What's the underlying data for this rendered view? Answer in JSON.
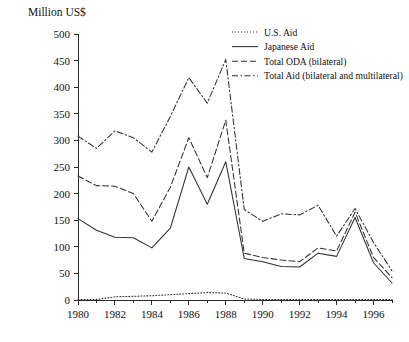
{
  "chart_data": {
    "type": "line",
    "title": "",
    "ylabel": "Million US$",
    "xlabel": "",
    "ylim": [
      0,
      500
    ],
    "xlim": [
      1980,
      1997
    ],
    "ytick_step": 50,
    "grid": false,
    "legend_position": "top-right",
    "yticks": [
      0,
      50,
      100,
      150,
      200,
      250,
      300,
      350,
      400,
      450,
      500
    ],
    "ytick_labels": [
      "0",
      "50",
      "100",
      "150",
      "200",
      "250",
      "300",
      "350",
      "400",
      "450",
      "500"
    ],
    "x": [
      1980,
      1981,
      1982,
      1983,
      1984,
      1985,
      1986,
      1987,
      1988,
      1989,
      1990,
      1991,
      1992,
      1993,
      1994,
      1995,
      1996,
      1997
    ],
    "xticks_major": [
      1980,
      1982,
      1984,
      1986,
      1988,
      1990,
      1992,
      1994,
      1996
    ],
    "xtick_labels": [
      "1980",
      "1982",
      "1984",
      "1986",
      "1988",
      "1990",
      "1992",
      "1994",
      "1996"
    ],
    "xticks_minor": [
      1981,
      1983,
      1985,
      1987,
      1989,
      1991,
      1993,
      1995,
      1997
    ],
    "series": [
      {
        "name": "U.S. Aid",
        "style": "dotted",
        "values": [
          1,
          1,
          6,
          7,
          8,
          10,
          12,
          14,
          13,
          2,
          1,
          1,
          1,
          1,
          1,
          1,
          1,
          1
        ]
      },
      {
        "name": "Japanese Aid",
        "style": "solid",
        "values": [
          153,
          131,
          118,
          117,
          98,
          135,
          250,
          180,
          260,
          78,
          72,
          63,
          62,
          88,
          82,
          155,
          70,
          32
        ]
      },
      {
        "name": "Total ODA (bilateral)",
        "style": "dashed",
        "values": [
          233,
          215,
          214,
          200,
          148,
          212,
          305,
          230,
          338,
          88,
          80,
          75,
          72,
          98,
          92,
          165,
          80,
          42
        ]
      },
      {
        "name": "Total Aid (bilateral and multilateral)",
        "style": "dashdot",
        "values": [
          308,
          285,
          318,
          305,
          278,
          345,
          418,
          370,
          452,
          170,
          148,
          162,
          160,
          178,
          120,
          172,
          108,
          55
        ]
      }
    ]
  },
  "legend": {
    "items": [
      {
        "label": "U.S. Aid",
        "style": "dotted"
      },
      {
        "label": "Japanese Aid",
        "style": "solid"
      },
      {
        "label": "Total ODA (bilateral)",
        "style": "dashed"
      },
      {
        "label": "Total Aid (bilateral and multilateral)",
        "style": "dashdot"
      }
    ]
  },
  "colors": {
    "line": "#2f2f2f",
    "axis": "#2b2b2b",
    "text": "#111111",
    "background": "#ffffff"
  }
}
